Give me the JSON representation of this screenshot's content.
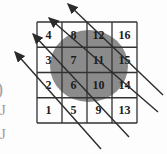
{
  "figure": {
    "grid": {
      "rows": [
        [
          "4",
          "8",
          "12",
          "16"
        ],
        [
          "3",
          "7",
          "11",
          "15"
        ],
        [
          "2",
          "6",
          "10",
          "14"
        ],
        [
          "1",
          "5",
          "9",
          "13"
        ]
      ]
    },
    "arrows": {
      "count": 4,
      "direction": "up-left"
    },
    "fragments": {
      "paren": ")",
      "bracket1": "J",
      "bracket2": "J"
    },
    "colors": {
      "background": "#fdfdfd",
      "circle_fill": "#8b8b8b",
      "grid_line": "#333333",
      "number": "#1c1c1c",
      "arrow": "#2b2b2b",
      "fragment": "#9e9ea2"
    }
  }
}
